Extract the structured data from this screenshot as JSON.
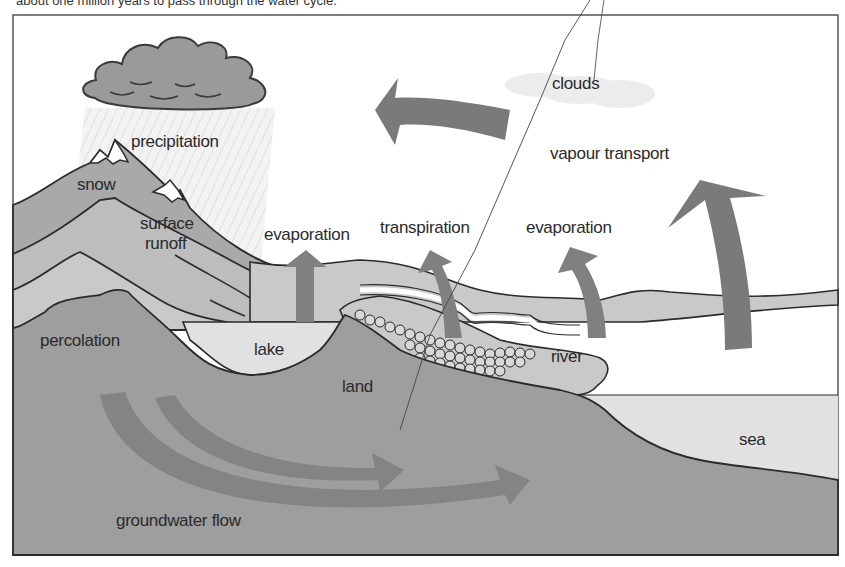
{
  "caption": "about one million years to pass through the water cycle.",
  "diagram": {
    "title": "The water cycle",
    "labels": {
      "precipitation": "precipitation",
      "snow": "snow",
      "surface_runoff_1": "surface",
      "surface_runoff_2": "runoff",
      "evaporation_lake": "evaporation",
      "transpiration": "transpiration",
      "evaporation_river": "evaporation",
      "clouds": "clouds",
      "vapour_transport": "vapour transport",
      "percolation": "percolation",
      "lake": "lake",
      "land": "land",
      "river": "river",
      "sea": "sea",
      "groundwater_flow": "groundwater flow"
    },
    "colors": {
      "frame": "#555555",
      "sky": "#ffffff",
      "mountain_dark": "#a9a9a9",
      "mountain_mid": "#bdbdbd",
      "mountain_light": "#c9c9c9",
      "ground": "#9e9e9e",
      "water": "#e1e1e1",
      "arrow": "#808080",
      "cloud_dark": "#9a9a9a",
      "cloud_light": "#e6e6e6",
      "snow": "#ffffff",
      "outline": "#2b2b2b"
    }
  }
}
